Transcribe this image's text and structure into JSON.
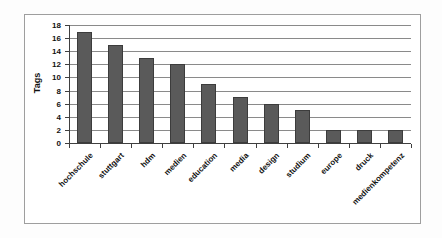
{
  "chart_data": {
    "type": "bar",
    "categories": [
      "hochschule",
      "stuttgart",
      "hdm",
      "medien",
      "education",
      "media",
      "design",
      "studium",
      "europe",
      "druck",
      "medienkompetenz"
    ],
    "values": [
      17,
      15,
      13,
      12,
      9,
      7,
      6,
      5,
      2,
      2,
      2
    ],
    "title": "",
    "xlabel": "",
    "ylabel": "Tags",
    "ylim": [
      0,
      18
    ],
    "ytick_step": 2,
    "ytick_labels": [
      "0",
      "2",
      "4",
      "6",
      "8",
      "10",
      "12",
      "14",
      "16",
      "18"
    ],
    "grid": "horizontal",
    "legend": "none",
    "colors": {
      "bar_fill": "#5a5a5a",
      "bar_border": "#3c3c3c",
      "gridline": "#8a8a8a",
      "axis": "#3f3f3f",
      "text": "#111111",
      "frame_border": "#9e9e9e",
      "plot_background": "#ffffff",
      "page_background": "#fdfdfd"
    }
  }
}
